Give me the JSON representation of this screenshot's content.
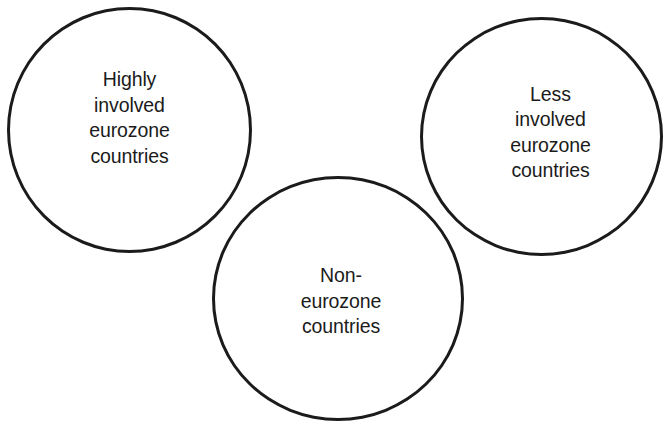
{
  "diagram": {
    "type": "venn-like-circles",
    "background_color": "#ffffff",
    "stroke_color": "#1b1b1b",
    "text_color": "#1b1b1b",
    "circles": [
      {
        "id": "highly-involved",
        "label": "Highly\ninvolved\neurozone\ncountries",
        "label_lines": [
          "Highly",
          "involved",
          "eurozone",
          "countries"
        ]
      },
      {
        "id": "less-involved",
        "label": "Less\ninvolved\neurozone\ncountries",
        "label_lines": [
          "Less",
          "involved",
          "eurozone",
          "countries"
        ]
      },
      {
        "id": "non-eurozone",
        "label": "Non-\neurozone\ncountries",
        "label_lines": [
          "Non-",
          "eurozone",
          "countries"
        ]
      }
    ]
  }
}
